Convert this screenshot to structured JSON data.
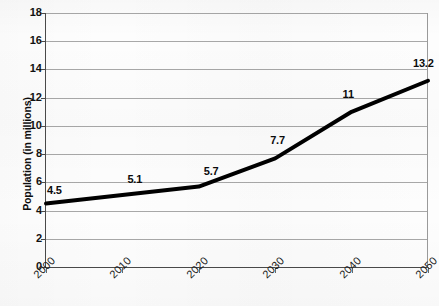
{
  "chart_data": {
    "type": "line",
    "title": "",
    "subtitle": "",
    "xlabel": "",
    "ylabel": "Population (in millions)",
    "categories": [
      "2000",
      "2010",
      "2020",
      "2030",
      "2040",
      "2050"
    ],
    "values": [
      4.5,
      5.1,
      5.7,
      7.7,
      11,
      13.2
    ],
    "point_labels": [
      "4.5",
      "5.1",
      "5.7",
      "7.7",
      "11",
      "13.2"
    ],
    "series": [
      {
        "name": "Population",
        "values": [
          4.5,
          5.1,
          5.7,
          7.7,
          11,
          13.2
        ],
        "color": "#000000"
      }
    ],
    "ylim": [
      0,
      18
    ],
    "ytick_step": 2,
    "yticks": [
      "18",
      "16",
      "14",
      "12",
      "10",
      "8",
      "6",
      "4",
      "2",
      "0"
    ],
    "ytick_values": [
      18,
      16,
      14,
      12,
      10,
      8,
      6,
      4,
      2,
      0
    ],
    "xticks": [
      "2000",
      "2010",
      "2020",
      "2030",
      "2040",
      "2050"
    ],
    "grid": "horizontal",
    "gridline_color": "#a8a8a8",
    "legend": "none",
    "legend_position": "none",
    "axis_color": "#4a4a4a",
    "background_color": "#fdfdfd",
    "line_width": 4,
    "xtick_label_rotation": -45
  }
}
